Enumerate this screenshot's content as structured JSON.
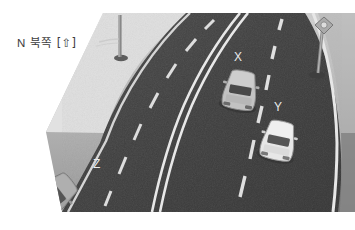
{
  "image": {
    "kind": "photograph",
    "subject": "curved divided highway seen from above and behind",
    "background_color": "#ffffff"
  },
  "overlay": {
    "north_label": {
      "letter": "N",
      "korean": "북쪽",
      "bracket_open": "[",
      "arrow_icon": "up-arrow-outline",
      "arrow_glyph": "⇧",
      "bracket_close": "]",
      "full_text": "N 북쪽 [⇧]",
      "color": "#3d3d3d"
    }
  },
  "scene": {
    "road": {
      "asphalt_color": "#3f3f3f",
      "asphalt_color_light": "#4a4a4a",
      "shoulder_color": "#9a9a9a",
      "marking_color": "#efefef",
      "median": {
        "type": "double-solid-white-line",
        "lines": 2
      },
      "left_carriageway": {
        "lane_divider": "dashed-white-line",
        "dash_count": 6
      },
      "right_carriageway": {
        "lane_divider": "dashed-white-line",
        "dash_count": 6,
        "outer_edge": "solid-white-line"
      }
    },
    "vehicles": [
      {
        "label": "X",
        "label_color": "#f2f2f2",
        "body_color": "#c9c9c9",
        "window_color": "#4c4c4c",
        "heading": "toward-viewer",
        "position_hint": "upper-middle-right, inner lane"
      },
      {
        "label": "Y",
        "label_color": "#f2f2f2",
        "body_color": "#efefef",
        "window_color": "#595959",
        "heading": "toward-viewer",
        "position_hint": "middle-right, outer lane"
      },
      {
        "label": "Z",
        "label_color": "#f2f2f2",
        "body_color": "#a8a8a8",
        "window_color": "#585858",
        "heading": "away-lower-left, angled",
        "position_hint": "lower-left carriageway"
      }
    ],
    "street_lamps": [
      {
        "name": "left-lamp-post",
        "position_hint": "top-left of road",
        "color": "#8d8d8d"
      },
      {
        "name": "right-lamp-post",
        "position_hint": "top-right beyond shoulder",
        "color": "#8d8d8d"
      }
    ]
  }
}
